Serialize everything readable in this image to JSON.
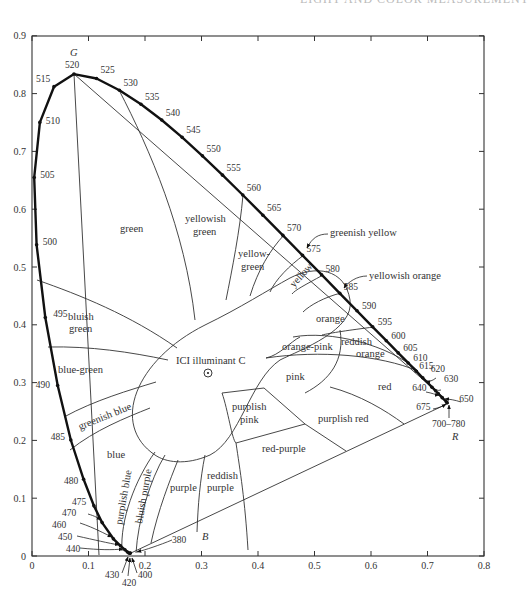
{
  "header": {
    "running_title": "LIGHT AND COLOR MEASUREMENT"
  },
  "chart_data": {
    "type": "scatter",
    "xlabel": "",
    "ylabel": "",
    "xlim": [
      0,
      0.8
    ],
    "ylim": [
      0,
      0.9
    ],
    "x_ticks": [
      "0",
      "0.1",
      "0.2",
      "0.3",
      "0.4",
      "0.5",
      "0.6",
      "0.7",
      "0.8"
    ],
    "y_ticks": [
      "0",
      "0.1",
      "0.2",
      "0.3",
      "0.4",
      "0.5",
      "0.6",
      "0.7",
      "0.8",
      "0.9"
    ],
    "grid": false,
    "corner_labels": {
      "green": "G",
      "red": "R",
      "blue": "B"
    },
    "white_point": {
      "label": "ICI illuminant C",
      "x": 0.3101,
      "y": 0.3162
    },
    "spectral_locus": [
      {
        "nm": "380",
        "x": 0.1741,
        "y": 0.005
      },
      {
        "nm": "400",
        "x": 0.1733,
        "y": 0.0048
      },
      {
        "nm": "420",
        "x": 0.1714,
        "y": 0.0051
      },
      {
        "nm": "430",
        "x": 0.1689,
        "y": 0.0069
      },
      {
        "nm": "440",
        "x": 0.1644,
        "y": 0.0109
      },
      {
        "nm": "450",
        "x": 0.1566,
        "y": 0.0177
      },
      {
        "nm": "460",
        "x": 0.144,
        "y": 0.0297
      },
      {
        "nm": "470",
        "x": 0.1241,
        "y": 0.0578
      },
      {
        "nm": "475",
        "x": 0.1096,
        "y": 0.0868
      },
      {
        "nm": "480",
        "x": 0.0913,
        "y": 0.1327
      },
      {
        "nm": "485",
        "x": 0.0687,
        "y": 0.2007
      },
      {
        "nm": "490",
        "x": 0.0454,
        "y": 0.295
      },
      {
        "nm": "495",
        "x": 0.0235,
        "y": 0.4127
      },
      {
        "nm": "500",
        "x": 0.0082,
        "y": 0.5384
      },
      {
        "nm": "505",
        "x": 0.0039,
        "y": 0.6548
      },
      {
        "nm": "510",
        "x": 0.0139,
        "y": 0.7502
      },
      {
        "nm": "515",
        "x": 0.0389,
        "y": 0.812
      },
      {
        "nm": "520",
        "x": 0.0743,
        "y": 0.8338
      },
      {
        "nm": "525",
        "x": 0.1142,
        "y": 0.8262
      },
      {
        "nm": "530",
        "x": 0.1547,
        "y": 0.8059
      },
      {
        "nm": "535",
        "x": 0.1929,
        "y": 0.7816
      },
      {
        "nm": "540",
        "x": 0.2296,
        "y": 0.7543
      },
      {
        "nm": "545",
        "x": 0.2658,
        "y": 0.7243
      },
      {
        "nm": "550",
        "x": 0.3016,
        "y": 0.6923
      },
      {
        "nm": "555",
        "x": 0.3373,
        "y": 0.6589
      },
      {
        "nm": "560",
        "x": 0.3731,
        "y": 0.6245
      },
      {
        "nm": "565",
        "x": 0.4087,
        "y": 0.5896
      },
      {
        "nm": "570",
        "x": 0.4441,
        "y": 0.5547
      },
      {
        "nm": "575",
        "x": 0.4788,
        "y": 0.5202
      },
      {
        "nm": "580",
        "x": 0.5125,
        "y": 0.4866
      },
      {
        "nm": "585",
        "x": 0.5448,
        "y": 0.4544
      },
      {
        "nm": "590",
        "x": 0.5752,
        "y": 0.4242
      },
      {
        "nm": "595",
        "x": 0.6029,
        "y": 0.3965
      },
      {
        "nm": "600",
        "x": 0.627,
        "y": 0.3725
      },
      {
        "nm": "605",
        "x": 0.6482,
        "y": 0.3514
      },
      {
        "nm": "610",
        "x": 0.6658,
        "y": 0.334
      },
      {
        "nm": "615",
        "x": 0.6801,
        "y": 0.3197
      },
      {
        "nm": "620",
        "x": 0.6915,
        "y": 0.3083
      },
      {
        "nm": "630",
        "x": 0.7079,
        "y": 0.292
      },
      {
        "nm": "640",
        "x": 0.719,
        "y": 0.2809
      },
      {
        "nm": "650",
        "x": 0.726,
        "y": 0.274
      },
      {
        "nm": "675",
        "x": 0.7334,
        "y": 0.2666
      },
      {
        "nm": "700–780",
        "x": 0.7347,
        "y": 0.2653
      }
    ],
    "region_labels": [
      "green",
      "yellowish green",
      "yellow-green",
      "greenish yellow",
      "yellow",
      "yellowish orange",
      "orange",
      "reddish orange",
      "orange-pink",
      "pink",
      "red",
      "purplish red",
      "purplish pink",
      "red-purple",
      "reddish purple",
      "purple",
      "bluish purple",
      "purplish blue",
      "blue",
      "greenish blue",
      "blue-green",
      "bluish green"
    ]
  },
  "labels": {
    "G": "G",
    "R": "R",
    "B": "B",
    "illuminant": "ICI illuminant C",
    "regions": {
      "green": "green",
      "yellowish": "yellowish",
      "yellowish_green2": "green",
      "yellow_dash": "yellow-",
      "yellow_green2": "green",
      "greenish_yellow": "greenish yellow",
      "yellow": "yellow",
      "yellowish_orange": "yellowish orange",
      "orange": "orange",
      "reddish": "reddish",
      "reddish_orange2": "orange",
      "orange_pink": "orange-pink",
      "pink": "pink",
      "red": "red",
      "purplish_red": "purplish red",
      "purplish": "purplish",
      "purplish_pink2": "pink",
      "red_purple": "red-purple",
      "reddish_p": "reddish",
      "reddish_purple2": "purple",
      "purple": "purple",
      "bluish_purple": "bluish purple",
      "purplish_blue": "purplish blue",
      "blue": "blue",
      "greenish_blue": "greenish blue",
      "blue_green": "blue-green",
      "bluish": "bluish",
      "bluish_green2": "green"
    }
  }
}
